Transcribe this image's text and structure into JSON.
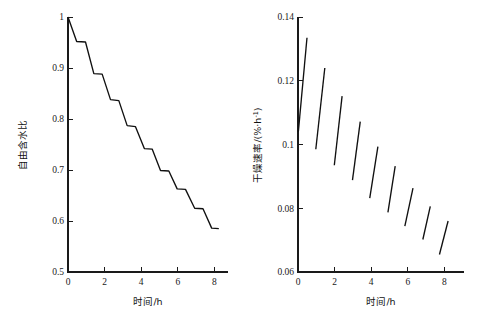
{
  "figure": {
    "background": "#ffffff",
    "line_color": "#101010",
    "axis_color": "#1a1a1a",
    "panel_count": 2
  },
  "chart_data": [
    {
      "id": "left",
      "type": "line",
      "title": "",
      "subtitle": "",
      "xlabel": "时间/h",
      "ylabel": "自由含水比",
      "xlim": [
        0,
        9.6
      ],
      "ylim": [
        0.5,
        1.0
      ],
      "xticks": [
        0,
        2,
        4,
        6,
        8
      ],
      "xtick_labels": [
        "0",
        "2",
        "4",
        "6",
        "8"
      ],
      "yticks": [
        0.5,
        0.6,
        0.7,
        0.8,
        0.9,
        1.0
      ],
      "ytick_labels": [
        "0.5",
        "0.6",
        "0.7",
        "0.8",
        "0.9",
        "1"
      ],
      "grid": false,
      "legend": false,
      "series": [
        {
          "name": "自由含水比",
          "x": [
            0.0,
            0.52,
            1.05,
            1.55,
            2.05,
            2.55,
            3.05,
            3.55,
            4.05,
            4.58,
            5.05,
            5.55,
            6.05,
            6.55,
            7.05,
            7.6,
            8.1,
            8.62,
            9.05
          ],
          "y": [
            1.0,
            0.952,
            0.951,
            0.889,
            0.888,
            0.838,
            0.836,
            0.787,
            0.785,
            0.742,
            0.741,
            0.699,
            0.698,
            0.663,
            0.662,
            0.625,
            0.624,
            0.586,
            0.585
          ]
        }
      ]
    },
    {
      "id": "right",
      "type": "line",
      "title": "",
      "subtitle": "",
      "xlabel": "时间/h",
      "ylabel_parts": {
        "main": "干燥速率/(%·h",
        "exponent": "-1",
        "tail": ")"
      },
      "ylabel": "干燥速率/(%·h-1)",
      "xlim": [
        0,
        9.6
      ],
      "ylim": [
        0.06,
        0.14
      ],
      "xticks": [
        0,
        2,
        4,
        6,
        8
      ],
      "xtick_labels": [
        "0",
        "2",
        "4",
        "6",
        "8"
      ],
      "yticks": [
        0.06,
        0.08,
        0.1,
        0.12,
        0.14
      ],
      "ytick_labels": [
        "0.06",
        "0.08",
        "0.1",
        "0.12",
        "0.14"
      ],
      "grid": false,
      "legend": false,
      "note": "nine disconnected rising segments, each spanning about 0.5 h",
      "segments": [
        {
          "index": 1,
          "x": [
            0.02,
            0.52
          ],
          "y": [
            0.104,
            0.1335
          ]
        },
        {
          "index": 2,
          "x": [
            1.03,
            1.55
          ],
          "y": [
            0.0985,
            0.124
          ]
        },
        {
          "index": 3,
          "x": [
            2.1,
            2.55
          ],
          "y": [
            0.0935,
            0.1152
          ]
        },
        {
          "index": 4,
          "x": [
            3.15,
            3.6
          ],
          "y": [
            0.0888,
            0.1072
          ]
        },
        {
          "index": 5,
          "x": [
            4.15,
            4.62
          ],
          "y": [
            0.0832,
            0.0993
          ]
        },
        {
          "index": 6,
          "x": [
            5.2,
            5.62
          ],
          "y": [
            0.0787,
            0.0932
          ]
        },
        {
          "index": 7,
          "x": [
            6.18,
            6.65
          ],
          "y": [
            0.0744,
            0.0863
          ]
        },
        {
          "index": 8,
          "x": [
            7.22,
            7.65
          ],
          "y": [
            0.0702,
            0.0806
          ]
        },
        {
          "index": 9,
          "x": [
            8.18,
            8.68
          ],
          "y": [
            0.0655,
            0.076
          ]
        }
      ]
    }
  ],
  "left_panel": {
    "name": "free-water-ratio-chart",
    "xlabel": "时间/h",
    "ylabel": "自由含水比",
    "xtick_labels": [
      "0",
      "2",
      "4",
      "6",
      "8"
    ],
    "ytick_labels": [
      "0.5",
      "0.6",
      "0.7",
      "0.8",
      "0.9",
      "1"
    ]
  },
  "right_panel": {
    "name": "drying-rate-chart",
    "xlabel": "时间/h",
    "ylabel_main": "干燥速率/(%·h",
    "ylabel_exponent": "-1",
    "ylabel_tail": ")",
    "xtick_labels": [
      "0",
      "2",
      "4",
      "6",
      "8"
    ],
    "ytick_labels": [
      "0.06",
      "0.08",
      "0.1",
      "0.12",
      "0.14"
    ]
  }
}
